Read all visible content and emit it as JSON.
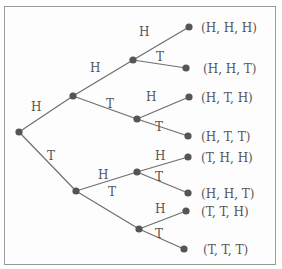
{
  "diagram": {
    "type": "probability-tree",
    "colors": {
      "edge": "#6e6e6e",
      "node": "#555555",
      "text": "#555555",
      "border": "#9a9a9a"
    },
    "branch_labels": {
      "root_H": "H",
      "root_T": "T",
      "H_H": "H",
      "H_T": "T",
      "T_H": "H",
      "T_T": "T",
      "HH_H": "H",
      "HH_T": "T",
      "HT_H": "H",
      "HT_T": "T",
      "TH_H": "H",
      "TH_T": "T",
      "TT_H": "H",
      "TT_T": "T"
    },
    "outcomes": [
      "(H, H, H)",
      "(H, H, T)",
      "(H, T, H)",
      "(H, T, T)",
      "(T, H, H)",
      "(H, H, T)",
      "(T, T, H)",
      "(T, T, T)"
    ]
  }
}
